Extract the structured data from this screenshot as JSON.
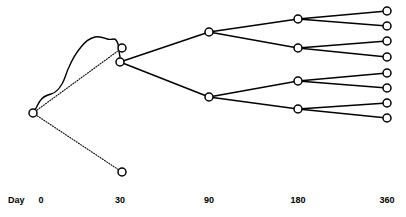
{
  "figure": {
    "type": "branching-tree-diagram",
    "width": 406,
    "height": 217,
    "background_color": "#ffffff",
    "line_color": "#000000",
    "node_fill_color": "#ffffff",
    "node_stroke_color": "#000000",
    "node_radius": 4,
    "edge_width": 1.4,
    "dotted_dash_pattern": "1,1.6"
  },
  "axis": {
    "name_label": "Day",
    "name_label_x": 8,
    "name_label_y": 196,
    "ticks": [
      {
        "label": "0",
        "x": 41,
        "y": 196
      },
      {
        "label": "30",
        "x": 120,
        "y": 196
      },
      {
        "label": "90",
        "x": 209,
        "y": 196
      },
      {
        "label": "180",
        "x": 298,
        "y": 196
      },
      {
        "label": "360",
        "x": 387,
        "y": 196
      }
    ]
  },
  "nodes": [
    {
      "id": "root",
      "name": "node-day-0-root",
      "x": 33,
      "y": 113,
      "day": 0
    },
    {
      "id": "d30a",
      "name": "node-day-30-upper",
      "x": 122,
      "y": 48,
      "day": 30
    },
    {
      "id": "d30b",
      "name": "node-day-30-middle",
      "x": 120,
      "y": 62,
      "day": 30
    },
    {
      "id": "d30c",
      "name": "node-day-30-lower",
      "x": 122,
      "y": 172,
      "day": 30
    },
    {
      "id": "d90a",
      "name": "node-day-90-upper",
      "x": 209,
      "y": 32,
      "day": 90
    },
    {
      "id": "d90b",
      "name": "node-day-90-lower",
      "x": 209,
      "y": 97,
      "day": 90
    },
    {
      "id": "d180a",
      "name": "node-day-180-1",
      "x": 298,
      "y": 19,
      "day": 180
    },
    {
      "id": "d180b",
      "name": "node-day-180-2",
      "x": 298,
      "y": 48,
      "day": 180
    },
    {
      "id": "d180c",
      "name": "node-day-180-3",
      "x": 298,
      "y": 81,
      "day": 180
    },
    {
      "id": "d180d",
      "name": "node-day-180-4",
      "x": 298,
      "y": 109,
      "day": 180
    },
    {
      "id": "d360a",
      "name": "node-day-360-1",
      "x": 387,
      "y": 11,
      "day": 360
    },
    {
      "id": "d360b",
      "name": "node-day-360-2",
      "x": 387,
      "y": 26,
      "day": 360
    },
    {
      "id": "d360c",
      "name": "node-day-360-3",
      "x": 387,
      "y": 41,
      "day": 360
    },
    {
      "id": "d360d",
      "name": "node-day-360-4",
      "x": 387,
      "y": 57,
      "day": 360
    },
    {
      "id": "d360e",
      "name": "node-day-360-5",
      "x": 387,
      "y": 73,
      "day": 360
    },
    {
      "id": "d360f",
      "name": "node-day-360-6",
      "x": 387,
      "y": 88,
      "day": 360
    },
    {
      "id": "d360g",
      "name": "node-day-360-7",
      "x": 387,
      "y": 103,
      "day": 360
    },
    {
      "id": "d360h",
      "name": "node-day-360-8",
      "x": 387,
      "y": 118,
      "day": 360
    }
  ],
  "edges": [
    {
      "name": "edge-root-to-day30-upper",
      "from": "root",
      "to": "d30a",
      "style": "dotted"
    },
    {
      "name": "edge-root-to-day30-lower",
      "from": "root",
      "to": "d30c",
      "style": "dotted"
    },
    {
      "name": "edge-day30-to-day90-upper",
      "from": "d30b",
      "to": "d90a",
      "style": "solid"
    },
    {
      "name": "edge-day30-to-day90-lower",
      "from": "d30b",
      "to": "d90b",
      "style": "solid"
    },
    {
      "name": "edge-day90u-to-day180-1",
      "from": "d90a",
      "to": "d180a",
      "style": "solid"
    },
    {
      "name": "edge-day90u-to-day180-2",
      "from": "d90a",
      "to": "d180b",
      "style": "solid"
    },
    {
      "name": "edge-day90l-to-day180-3",
      "from": "d90b",
      "to": "d180c",
      "style": "solid"
    },
    {
      "name": "edge-day90l-to-day180-4",
      "from": "d90b",
      "to": "d180d",
      "style": "solid"
    },
    {
      "name": "edge-day180-1-to-day360-1",
      "from": "d180a",
      "to": "d360a",
      "style": "solid"
    },
    {
      "name": "edge-day180-1-to-day360-2",
      "from": "d180a",
      "to": "d360b",
      "style": "solid"
    },
    {
      "name": "edge-day180-2-to-day360-3",
      "from": "d180b",
      "to": "d360c",
      "style": "solid"
    },
    {
      "name": "edge-day180-2-to-day360-4",
      "from": "d180b",
      "to": "d360d",
      "style": "solid"
    },
    {
      "name": "edge-day180-3-to-day360-5",
      "from": "d180c",
      "to": "d360e",
      "style": "solid"
    },
    {
      "name": "edge-day180-3-to-day360-6",
      "from": "d180c",
      "to": "d360f",
      "style": "solid"
    },
    {
      "name": "edge-day180-4-to-day360-7",
      "from": "d180d",
      "to": "d360g",
      "style": "solid"
    },
    {
      "name": "edge-day180-4-to-day360-8",
      "from": "d180d",
      "to": "d360h",
      "style": "solid"
    }
  ],
  "curve": {
    "name": "wavy-solid-curve",
    "style": "solid",
    "path": "M 33,113 C 36,110 37,105 40,101 C 43,96 47,95 51,94 C 56,93 59,89 62,84 C 65,79 66,73 69,67 C 72,60 76,53 81,47 C 85,42 90,38 95,37 C 100,36 104,38 107,39 C 110,40 112,39 114,39 C 116,39 117,41 118,44 C 119,48 119,53 120,57"
  }
}
